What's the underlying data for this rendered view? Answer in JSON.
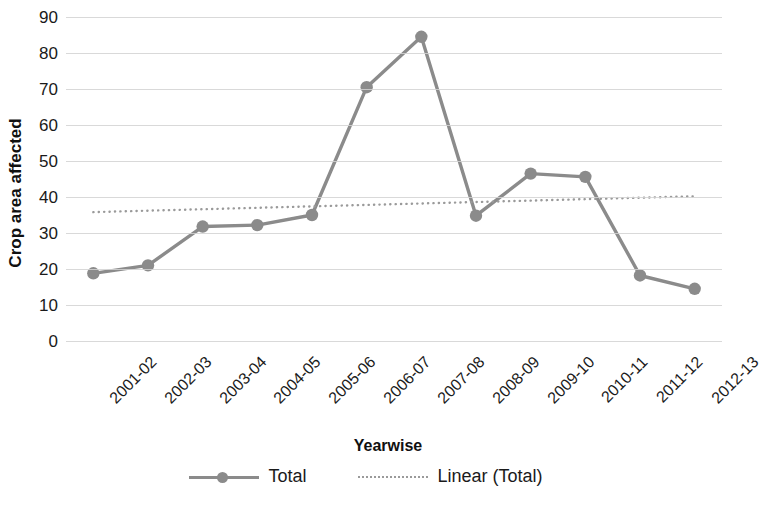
{
  "chart_data": {
    "type": "line",
    "title": "",
    "xlabel": "Yearwise",
    "ylabel": "Crop area affected",
    "categories": [
      "2001-02",
      "2002-03",
      "2003-04",
      "2004-05",
      "2005-06",
      "2006-07",
      "2007-08",
      "2008-09",
      "2009-10",
      "2010-11",
      "2011-12",
      "2012-13"
    ],
    "series": [
      {
        "name": "Total",
        "style": "solid-with-markers",
        "color": "#8b8b8b",
        "values": [
          18.8,
          21.0,
          31.8,
          32.2,
          35.0,
          70.5,
          84.5,
          34.8,
          46.5,
          45.6,
          18.2,
          14.5
        ]
      },
      {
        "name": "Linear (Total)",
        "style": "dotted-trendline",
        "color": "#9a9a9a",
        "values": [
          35.8,
          36.2,
          36.6,
          37.0,
          37.4,
          37.8,
          38.2,
          38.6,
          39.0,
          39.4,
          39.8,
          40.2
        ]
      }
    ],
    "ylim": [
      0,
      90
    ],
    "y_ticks": [
      "0",
      "10",
      "20",
      "30",
      "40",
      "50",
      "60",
      "70",
      "80",
      "90"
    ],
    "y_tick_values": [
      0,
      10,
      20,
      30,
      40,
      50,
      60,
      70,
      80,
      90
    ],
    "grid": true,
    "grid_color": "#d2d2d2",
    "legend_position": "bottom",
    "legend": [
      {
        "label": "Total",
        "marker": "circle",
        "line": "solid",
        "color": "#8b8b8b"
      },
      {
        "label": "Linear (Total)",
        "marker": "none",
        "line": "dotted",
        "color": "#9a9a9a"
      }
    ]
  }
}
